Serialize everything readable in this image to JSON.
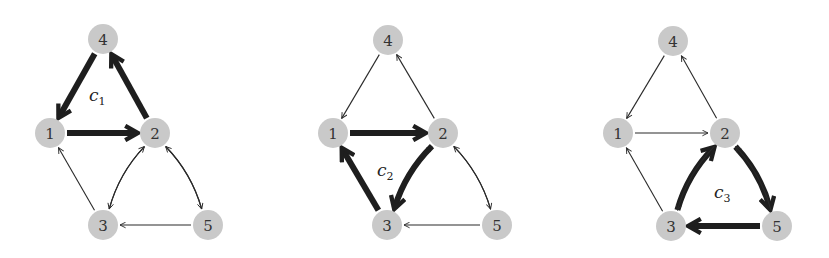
{
  "figure": {
    "colors": {
      "node_fill": "#c9c9c9",
      "edge": "#2a2a2a",
      "highlight_edge": "#1e1e1e",
      "background": "#ffffff"
    },
    "nodes": [
      "1",
      "2",
      "3",
      "4",
      "5"
    ],
    "edges": [
      {
        "from": "4",
        "to": "1"
      },
      {
        "from": "1",
        "to": "2"
      },
      {
        "from": "2",
        "to": "4"
      },
      {
        "from": "3",
        "to": "1"
      },
      {
        "from": "3",
        "to": "2"
      },
      {
        "from": "2",
        "to": "3"
      },
      {
        "from": "2",
        "to": "5"
      },
      {
        "from": "5",
        "to": "2"
      },
      {
        "from": "5",
        "to": "3"
      }
    ],
    "panels": [
      {
        "cycle_label": "c",
        "cycle_index": "1",
        "cycle_edges": [
          "4→1",
          "1→2",
          "2→4"
        ],
        "positions": {
          "1": [
            50,
            133
          ],
          "2": [
            155,
            133
          ],
          "3": [
            103,
            225
          ],
          "4": [
            103,
            39
          ],
          "5": [
            208,
            225
          ]
        },
        "label_pos": [
          89,
          101
        ]
      },
      {
        "cycle_label": "c",
        "cycle_index": "2",
        "cycle_edges": [
          "1→2",
          "2→3",
          "3→1"
        ],
        "positions": {
          "1": [
            333,
            133
          ],
          "2": [
            443,
            133
          ],
          "3": [
            387,
            225
          ],
          "4": [
            388,
            40
          ],
          "5": [
            497,
            225
          ]
        },
        "label_pos": [
          377,
          176
        ]
      },
      {
        "cycle_label": "c",
        "cycle_index": "3",
        "cycle_edges": [
          "2→5",
          "5→3",
          "3→2"
        ],
        "positions": {
          "1": [
            618,
            133
          ],
          "2": [
            725,
            133
          ],
          "3": [
            671,
            226
          ],
          "4": [
            673,
            41
          ],
          "5": [
            777,
            226
          ]
        },
        "label_pos": [
          714,
          198
        ]
      }
    ]
  }
}
